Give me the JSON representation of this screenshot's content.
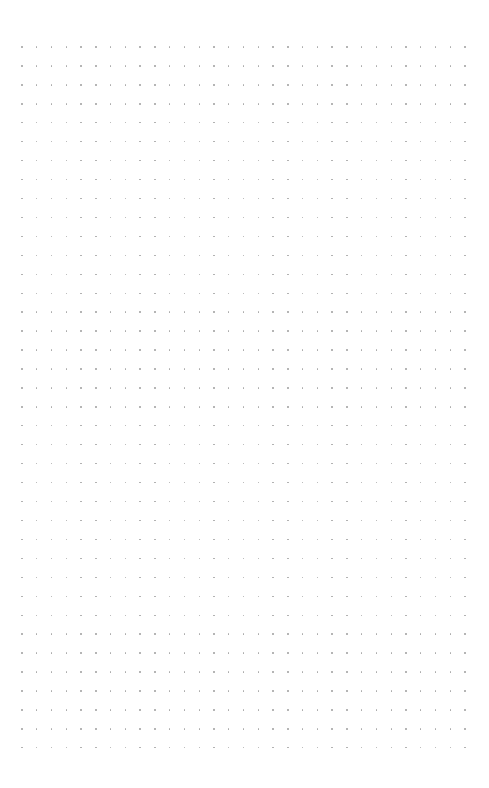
{
  "page": {
    "type": "dot-grid",
    "background_color": "#ffffff",
    "dot_color": "#a8a8a8",
    "grid": {
      "columns": 31,
      "rows": 38,
      "origin_x": 22,
      "origin_y": 47,
      "spacing_x": 14.77,
      "spacing_y": 18.94
    }
  }
}
